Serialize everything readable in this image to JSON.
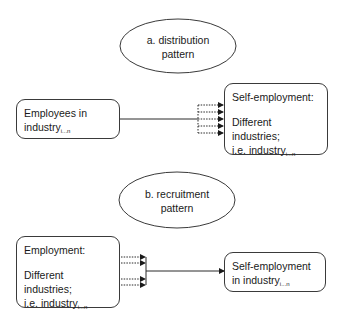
{
  "panels": [
    {
      "id": "a",
      "title_line1": "a. distribution",
      "title_line2": "pattern",
      "source_box": {
        "line1": "Employees in",
        "line2_main": "industry",
        "line2_sub": "i...n"
      },
      "target_box": {
        "line1": "Self-employment:",
        "line2": "Different industries;",
        "line3_main": "i.e. industry",
        "line3_sub": "i...n"
      },
      "dotted_arrows": 5
    },
    {
      "id": "b",
      "title_line1": "b. recruitment",
      "title_line2": "pattern",
      "source_box": {
        "line1": "Employment:",
        "line2": "Different industries;",
        "line3_main": "i.e. industry",
        "line3_sub": "i...n"
      },
      "target_box": {
        "line1": "Self-employment",
        "line2_main": "in industry",
        "line2_sub": "i...n"
      },
      "dotted_arrows": 4
    }
  ],
  "colors": {
    "line": "#2a2a2a",
    "border": "#3a3a3a",
    "background": "#ffffff"
  }
}
